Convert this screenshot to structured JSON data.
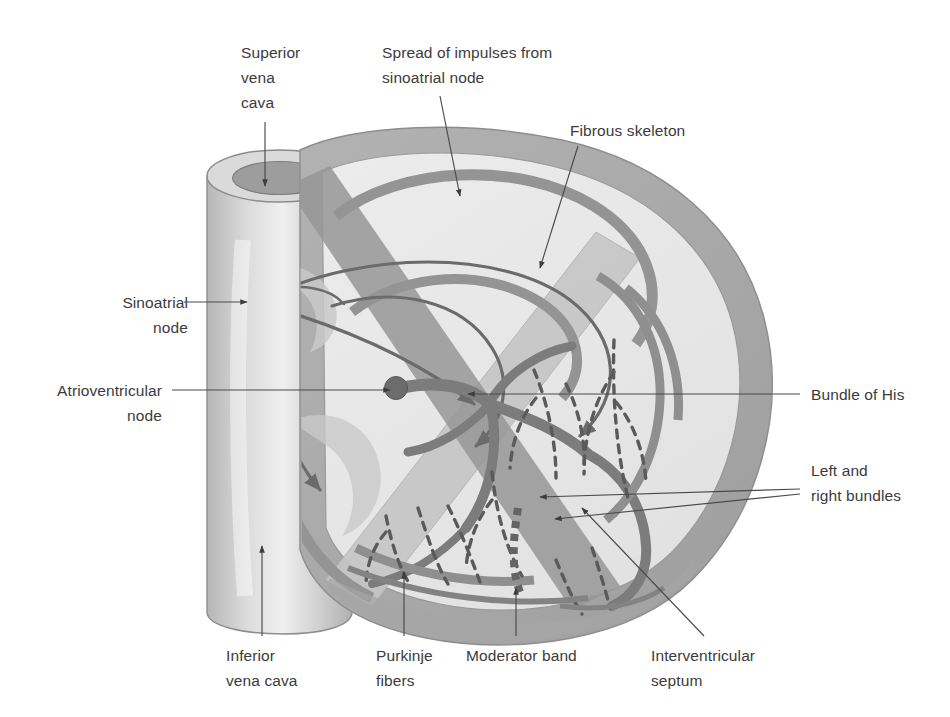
{
  "figure": {
    "type": "anatomical-diagram",
    "background_color": "#ffffff",
    "text_color": "#3b3b3b",
    "leader_line_color": "#4a4a4a"
  },
  "palette": {
    "myocardium_outer": "#aaaaaa",
    "myocardium_mid": "#b9b9b9",
    "chamber_interior": "#e9e9e9",
    "chamber_interior_light": "#eeeeee",
    "conduction_pathway": "#8c8c8c",
    "conduction_dark": "#7a7a7a",
    "node_fill": "#6e6e6e",
    "vessel_fill": "#d8d8d8",
    "vessel_lumen": "#9a9a9a",
    "fibrous_skeleton": "#c4c4c4",
    "purkinje_dash": "#5f5f5f",
    "moderator_band": "#6a6a6a"
  },
  "labels": [
    {
      "id": "superior-vena-cava",
      "name": "Superior vena cava",
      "lines": [
        "Superior",
        "vena",
        "cava"
      ],
      "align": "left",
      "x": 241,
      "y": 40,
      "leader": {
        "from": [
          265,
          122
        ],
        "to": [
          265,
          186
        ],
        "arrow": "end"
      }
    },
    {
      "id": "spread-of-impulses",
      "name": "Spread of impulses from sinoatrial node",
      "lines": [
        "Spread of impulses from",
        "sinoatrial node"
      ],
      "align": "left",
      "x": 382,
      "y": 40,
      "leader": {
        "from": [
          440,
          96
        ],
        "to": [
          460,
          196
        ],
        "arrow": "end"
      }
    },
    {
      "id": "fibrous-skeleton",
      "name": "Fibrous skeleton",
      "lines": [
        "Fibrous skeleton"
      ],
      "align": "left",
      "x": 570,
      "y": 118,
      "leader": {
        "from": [
          578,
          146
        ],
        "to": [
          540,
          268
        ],
        "arrow": "end"
      }
    },
    {
      "id": "sinoatrial-node",
      "name": "Sinoatrial node",
      "lines": [
        "Sinoatrial",
        "node"
      ],
      "align": "right",
      "x": 68,
      "y": 290,
      "leader": {
        "from": [
          184,
          302
        ],
        "to": [
          247,
          302
        ],
        "arrow": "end"
      }
    },
    {
      "id": "atrioventricular-node",
      "name": "Atrioventricular node",
      "lines": [
        "Atrioventricular",
        "node"
      ],
      "align": "right",
      "x": 42,
      "y": 378,
      "leader": {
        "from": [
          172,
          390
        ],
        "to": [
          390,
          390
        ],
        "arrow": "end"
      }
    },
    {
      "id": "bundle-of-his",
      "name": "Bundle of His",
      "lines": [
        "Bundle of His"
      ],
      "align": "left",
      "x": 811,
      "y": 382,
      "leader": {
        "from": [
          800,
          394
        ],
        "to": [
          468,
          394
        ],
        "arrow": "end"
      }
    },
    {
      "id": "left-and-right-bundles",
      "name": "Left and right bundles",
      "lines": [
        "Left and",
        "right bundles"
      ],
      "align": "left",
      "x": 811,
      "y": 458,
      "leader": {
        "from": [
          800,
          489
        ],
        "to": [
          540,
          497
        ],
        "arrow": "end"
      },
      "leader2": {
        "from": [
          800,
          494
        ],
        "to": [
          555,
          519
        ],
        "arrow": "end"
      }
    },
    {
      "id": "inferior-vena-cava",
      "name": "Inferior vena cava",
      "lines": [
        "Inferior",
        "vena cava"
      ],
      "align": "left",
      "x": 226,
      "y": 643,
      "leader": {
        "from": [
          262,
          636
        ],
        "to": [
          262,
          546
        ],
        "arrow": "end"
      }
    },
    {
      "id": "purkinje-fibers",
      "name": "Purkinje fibers",
      "lines": [
        "Purkinje",
        "fibers"
      ],
      "align": "left",
      "x": 376,
      "y": 643,
      "leader": {
        "from": [
          404,
          636
        ],
        "to": [
          404,
          572
        ],
        "arrow": "end"
      }
    },
    {
      "id": "moderator-band",
      "name": "Moderator band",
      "lines": [
        "Moderator band"
      ],
      "align": "left",
      "x": 466,
      "y": 643,
      "leader": {
        "from": [
          516,
          636
        ],
        "to": [
          516,
          588
        ],
        "arrow": "end"
      }
    },
    {
      "id": "interventricular-septum",
      "name": "Interventricular septum",
      "lines": [
        "Interventricular",
        "septum"
      ],
      "align": "left",
      "x": 651,
      "y": 643,
      "leader": {
        "from": [
          704,
          636
        ],
        "to": [
          582,
          508
        ],
        "arrow": "end"
      }
    }
  ],
  "structures": [
    {
      "id": "sa-node",
      "name": "Sinoatrial node",
      "shape": "filled-circle",
      "cx": 258,
      "cy": 302,
      "r": 13
    },
    {
      "id": "av-node",
      "name": "Atrioventricular node",
      "shape": "filled-circle",
      "cx": 396,
      "cy": 388,
      "r": 11
    },
    {
      "id": "superior-vena-cava-vessel",
      "name": "Superior vena cava",
      "shape": "cylinder"
    },
    {
      "id": "inferior-vena-cava-vessel",
      "name": "Inferior vena cava",
      "shape": "cylinder"
    },
    {
      "id": "impulse-arrows",
      "name": "Spread of impulses arrows",
      "count": 5
    },
    {
      "id": "purkinje-network",
      "name": "Purkinje fiber network",
      "shape": "dashed-branches"
    },
    {
      "id": "moderator-band-structure",
      "name": "Moderator band",
      "shape": "dotted-band"
    },
    {
      "id": "fibrous-skeleton-band",
      "name": "Fibrous skeleton",
      "shape": "diagonal-band"
    }
  ]
}
